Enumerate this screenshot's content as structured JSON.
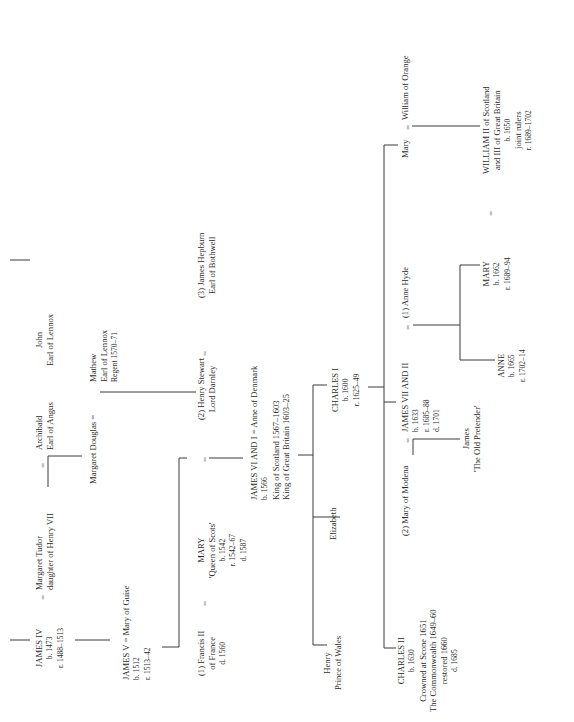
{
  "marriage_symbol": "=",
  "people": {
    "james_iv": {
      "lines": [
        "JAMES IV",
        "b. 1473",
        "r. 1488–1513"
      ]
    },
    "margaret_tudor": {
      "lines": [
        "Margaret Tudor",
        "daughter of Henry VII"
      ]
    },
    "archibald": {
      "lines": [
        "Archibald",
        "Earl of Angus"
      ]
    },
    "john_lennox": {
      "lines": [
        "John",
        "Earl of Lennox"
      ]
    },
    "james_v": {
      "lines": [
        "JAMES V  =  Mary of Guise",
        "b. 1512",
        "r. 1513–42"
      ]
    },
    "margaret_douglas": {
      "lines": [
        "Margaret Douglas  ="
      ]
    },
    "mathew": {
      "lines": [
        "Mathew",
        "Earl of Lennox",
        "Regent 1570–71"
      ]
    },
    "francis_ii": {
      "lines": [
        "(1) Francis II",
        "of France",
        "d. 1560"
      ]
    },
    "mary_qos": {
      "lines": [
        "MARY",
        "'Queen of Scots'",
        "b. 1542",
        "r. 1542–67",
        "d. 1587"
      ]
    },
    "henry_darnley": {
      "lines": [
        "(2) Henry Stewart",
        "Lord Darnley"
      ]
    },
    "james_hepburn": {
      "lines": [
        "(3) James Hepburn",
        "Earl of Bothwell"
      ]
    },
    "james_vi": {
      "lines": [
        "JAMES VI AND I  =  Anne of Denmark",
        "b. 1566",
        "King of Scotland 1567–1603",
        "King of Great Britain 1603–25"
      ]
    },
    "henry_wales": {
      "lines": [
        "Henry",
        "Prince of Wales"
      ]
    },
    "elizabeth": {
      "lines": [
        "Elizabeth"
      ]
    },
    "charles_i": {
      "lines": [
        "CHARLES I",
        "b. 1600",
        "r. 1625–49"
      ]
    },
    "charles_ii": {
      "lines": [
        "CHARLES II",
        "b. 1630",
        "Crowned at Scone 1651",
        "The Commonwealth 1649–60",
        "restored 1660",
        "d. 1685"
      ]
    },
    "mary_modena": {
      "lines": [
        "(2) Mary of Modena"
      ]
    },
    "james_vii": {
      "lines": [
        "JAMES VII AND II",
        "b. 1633",
        "r. 1685–88",
        "d. 1701"
      ]
    },
    "anne_hyde": {
      "lines": [
        "(1) Anne Hyde"
      ]
    },
    "mary_orange": {
      "lines": [
        "Mary"
      ]
    },
    "william_orange": {
      "lines": [
        "William of Orange"
      ]
    },
    "james_pretender": {
      "lines": [
        "James",
        "'The Old Pretender'"
      ]
    },
    "anne": {
      "lines": [
        "ANNE",
        "b. 1665",
        "r. 1702–14"
      ]
    },
    "mary_ii": {
      "lines": [
        "MARY",
        "b. 1662",
        "r. 1689–94"
      ]
    },
    "william_iii": {
      "lines": [
        "WILLIAM II of Scotland",
        "and III of Great Britain",
        "b. 1650",
        "joint rulers",
        "r. 1689–1702"
      ]
    }
  }
}
